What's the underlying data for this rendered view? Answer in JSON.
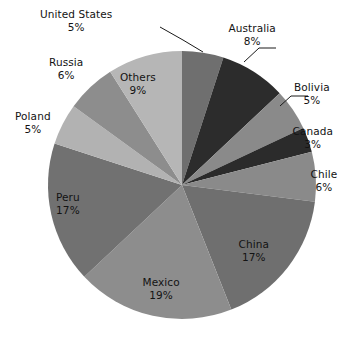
{
  "chart_data": {
    "type": "pie",
    "title": "",
    "subtitle": "",
    "xlabel": "",
    "ylabel": "",
    "legend_position": "none",
    "grid": false,
    "units": "percent",
    "start_angle_deg": 0,
    "direction": "clockwise",
    "total": 100,
    "categories": [
      "United States",
      "Australia",
      "Bolivia",
      "Canada",
      "Chile",
      "China",
      "Mexico",
      "Peru",
      "Poland",
      "Russia",
      "Others"
    ],
    "values": [
      5,
      8,
      5,
      3,
      6,
      17,
      19,
      17,
      5,
      6,
      9
    ],
    "slices": [
      {
        "label": "United States",
        "value": 5,
        "value_text": "5%",
        "color": "#6f6f6f",
        "label_placement": "outside",
        "leader_line": true,
        "label_x": 76,
        "label_y": 8
      },
      {
        "label": "Australia",
        "value": 8,
        "value_text": "8%",
        "color": "#2c2c2c",
        "label_placement": "outside",
        "leader_line": true,
        "label_x": 252,
        "label_y": 22
      },
      {
        "label": "Bolivia",
        "value": 5,
        "value_text": "5%",
        "color": "#8a8a8a",
        "label_placement": "outside",
        "leader_line": true,
        "label_x": 312,
        "label_y": 81
      },
      {
        "label": "Canada",
        "value": 3,
        "value_text": "3%",
        "color": "#2b2b2b",
        "label_placement": "outside",
        "leader_line": false,
        "label_x": 313,
        "label_y": 125
      },
      {
        "label": "Chile",
        "value": 6,
        "value_text": "6%",
        "color": "#8a8a8a",
        "label_placement": "outside",
        "leader_line": false,
        "label_x": 324,
        "label_y": 168
      },
      {
        "label": "China",
        "value": 17,
        "value_text": "17%",
        "color": "#6f6f6f",
        "label_placement": "inside",
        "leader_line": false,
        "label_x": 254,
        "label_y": 238
      },
      {
        "label": "Mexico",
        "value": 19,
        "value_text": "19%",
        "color": "#8d8d8d",
        "label_placement": "inside",
        "leader_line": false,
        "label_x": 161,
        "label_y": 276
      },
      {
        "label": "Peru",
        "value": 17,
        "value_text": "17%",
        "color": "#717171",
        "label_placement": "inside",
        "leader_line": false,
        "label_x": 68,
        "label_y": 191
      },
      {
        "label": "Poland",
        "value": 5,
        "value_text": "5%",
        "color": "#b2b2b2",
        "label_placement": "outside",
        "leader_line": false,
        "label_x": 33,
        "label_y": 110
      },
      {
        "label": "Russia",
        "value": 6,
        "value_text": "6%",
        "color": "#8d8d8d",
        "label_placement": "outside",
        "leader_line": false,
        "label_x": 66,
        "label_y": 56
      },
      {
        "label": "Others",
        "value": 9,
        "value_text": "9%",
        "color": "#b6b6b6",
        "label_placement": "inside",
        "leader_line": false,
        "label_x": 138,
        "label_y": 71
      }
    ],
    "geometry": {
      "center_x": 182,
      "center_y": 185,
      "radius": 134
    },
    "leader_lines": [
      {
        "for": "United States",
        "points": "160,27 183,40 203,52"
      },
      {
        "for": "Australia",
        "points": "276,48 259,48 244,62"
      },
      {
        "for": "Bolivia",
        "points": "308,96 291,96 280,106"
      }
    ]
  }
}
